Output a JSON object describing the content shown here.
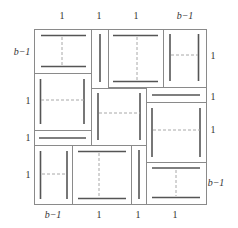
{
  "diagram": {
    "type": "pinwheel-tiling",
    "colors": {
      "border": "#8a8a8a",
      "bar": "#555555",
      "dash": "#a8a8a8",
      "label": "#333333"
    },
    "labels": {
      "top": [
        "1",
        "1",
        "1",
        "b−1"
      ],
      "left": [
        "b−1",
        "1",
        "1",
        "1"
      ],
      "right": [
        "1",
        "1",
        "1",
        "b−1"
      ],
      "bottom": [
        "b−1",
        "1",
        "1",
        "1"
      ]
    },
    "tiles": [
      {
        "id": "A",
        "orientation": "horizontal"
      },
      {
        "id": "B",
        "orientation": "horizontal"
      },
      {
        "id": "C",
        "orientation": "vertical"
      },
      {
        "id": "D",
        "orientation": "vertical"
      },
      {
        "id": "E",
        "orientation": "vertical"
      },
      {
        "id": "F",
        "orientation": "vertical"
      },
      {
        "id": "G",
        "orientation": "vertical"
      },
      {
        "id": "H",
        "orientation": "horizontal"
      },
      {
        "id": "I",
        "orientation": "horizontal"
      }
    ]
  }
}
